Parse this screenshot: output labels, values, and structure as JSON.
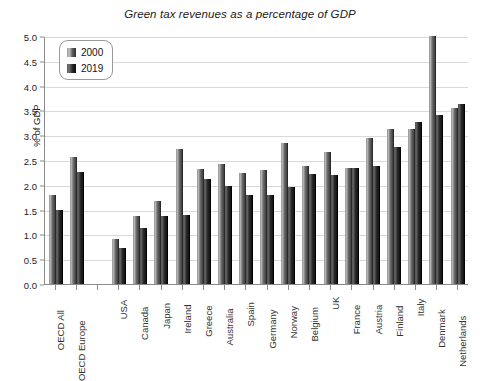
{
  "chart_data": {
    "type": "bar",
    "title": "Green tax revenues as a percentage of GDP",
    "xlabel": "",
    "ylabel": "% of GDP",
    "ylim": [
      0,
      5.0
    ],
    "ytick_step": 0.5,
    "yticks": [
      "0.0",
      "0.5",
      "1.0",
      "1.5",
      "2.0",
      "2.5",
      "3.0",
      "3.5",
      "4.0",
      "4.5",
      "5.0"
    ],
    "grid": true,
    "legend_position": "top-left",
    "categories": [
      "OECD All",
      "OECD Europe",
      "",
      "USA",
      "Canada",
      "Japan",
      "Ireland",
      "Greece",
      "Australia",
      "Spain",
      "Germany",
      "Norway",
      "Belgium",
      "UK",
      "France",
      "Austria",
      "Finland",
      "Italy",
      "Denmark",
      "Netherlands"
    ],
    "series": [
      {
        "name": "2000",
        "color": "#8f8f8f",
        "values": [
          1.79,
          2.57,
          null,
          0.9,
          1.37,
          1.67,
          2.73,
          2.32,
          2.41,
          2.24,
          2.3,
          2.85,
          2.37,
          2.67,
          2.34,
          2.94,
          3.13,
          3.12,
          5.0,
          3.55
        ]
      },
      {
        "name": "2019",
        "color": "#1b1b1b",
        "values": [
          1.5,
          2.25,
          null,
          0.73,
          1.13,
          1.37,
          1.4,
          2.12,
          1.97,
          1.8,
          1.8,
          1.95,
          2.22,
          2.2,
          2.33,
          2.37,
          2.77,
          3.27,
          3.4,
          3.62
        ]
      }
    ]
  },
  "legend": {
    "items": [
      {
        "label": "2000"
      },
      {
        "label": "2019"
      }
    ]
  }
}
